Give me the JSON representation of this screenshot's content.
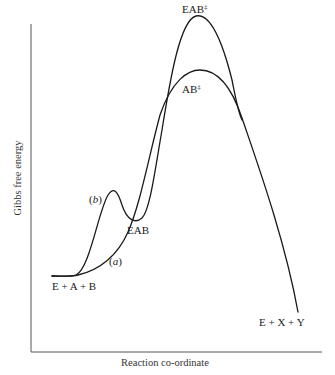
{
  "figure": {
    "type": "reaction-energy-profile",
    "axes": {
      "y_label": "Gibbs free energy",
      "x_label": "Reaction co-ordinate"
    },
    "curves": [
      {
        "id": "a",
        "label": "(a)",
        "label_letter": "a",
        "description": "uncatalysed reaction",
        "path": "M 52 276 C 62 276 70 277 78 275 C 100 270 118 255 128 232 C 140 205 148 160 160 115 C 172 80 188 70 200 70 C 218 70 232 88 242 118 C 258 165 285 240 298 312"
      },
      {
        "id": "b",
        "label": "(b)",
        "label_letter": "b",
        "description": "enzyme-catalysed reaction",
        "path": "M 52 276 C 62 276 70 277 76 275 C 90 268 98 212 108 195 C 114 186 118 192 122 205 C 127 220 135 224 142 218 C 150 210 155 170 162 130 C 170 80 180 20 196 16 C 210 13 222 40 232 80 C 236 100 238 112 242 120"
      }
    ],
    "labels": {
      "start": "E + A + B",
      "end": "E + X + Y",
      "intermediate": "EAB",
      "ts_enzyme_base": "EAB",
      "ts_enzyme_sup": "‡",
      "ts_uncat_base": "AB",
      "ts_uncat_sup": "‡",
      "curve_a_open": "(",
      "curve_a_letter": "a",
      "curve_a_close": ")",
      "curve_b_open": "(",
      "curve_b_letter": "b",
      "curve_b_close": ")"
    },
    "colors": {
      "ink": "#1a1a1a",
      "axis": "#555555",
      "background": "#ffffff"
    }
  }
}
